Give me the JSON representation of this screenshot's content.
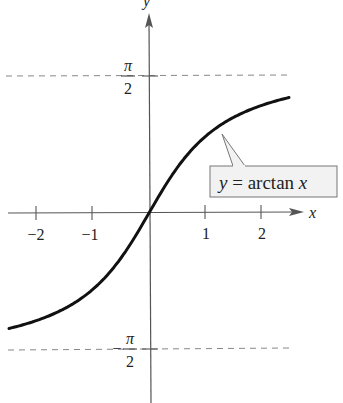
{
  "chart_data": {
    "type": "line",
    "title": "",
    "xlabel": "x",
    "ylabel": "y",
    "function": "y = arctan x",
    "x_ticks": [
      -2,
      -1,
      1,
      2
    ],
    "x_tick_labels": [
      "−2",
      "−1",
      "1",
      "2"
    ],
    "y_ticks": [
      1.5708,
      -1.5708
    ],
    "y_tick_labels": [
      {
        "sign": "",
        "num": "π",
        "den": "2"
      },
      {
        "sign": "−",
        "num": "π",
        "den": "2"
      }
    ],
    "asymptotes": [
      {
        "y": 1.5708,
        "style": "dashed",
        "label": "π/2"
      },
      {
        "y": -1.5708,
        "style": "dashed",
        "label": "−π/2"
      }
    ],
    "xlim": [
      -2.6,
      2.6
    ],
    "ylim": [
      -2.2,
      2.4
    ],
    "grid": false,
    "series": [
      {
        "name": "y = arctan x",
        "x": [
          -2.5,
          -2.0,
          -1.5,
          -1.0,
          -0.5,
          0,
          0.5,
          1.0,
          1.5,
          2.0,
          2.5
        ],
        "y": [
          -1.19,
          -1.107,
          -0.983,
          -0.785,
          -0.464,
          0,
          0.464,
          0.785,
          0.983,
          1.107,
          1.19
        ]
      }
    ],
    "annotation": {
      "text_var": "y",
      "text_eq": " = ",
      "text_fn": "arctan ",
      "text_arg": "x",
      "points_to_x": 1.3
    },
    "colors": {
      "curve": "#111111",
      "axes": "#555555",
      "asymptote": "#888888",
      "label_box_fill": "#f2f2f2",
      "label_box_stroke": "#777777"
    }
  }
}
